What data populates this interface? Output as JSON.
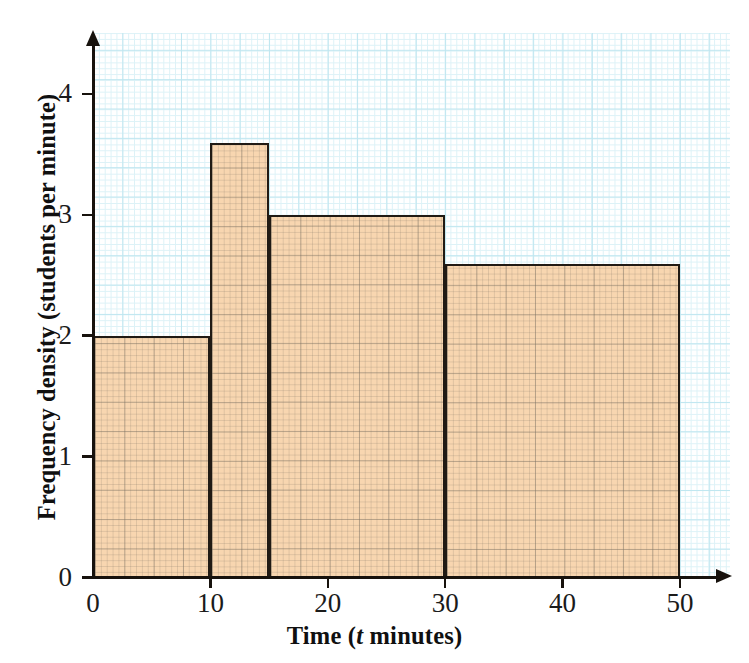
{
  "chart_data": {
    "type": "bar",
    "title": "",
    "subtitle": "",
    "xlabel_parts": {
      "before": "Time (",
      "italic": "t",
      "after": " minutes)"
    },
    "xlabel": "Time (t minutes)",
    "ylabel": "Frequency density (students per minute)",
    "xlim": [
      0,
      50
    ],
    "ylim": [
      0,
      4.5
    ],
    "x_ticks": [
      0,
      10,
      20,
      30,
      40,
      50
    ],
    "x_tick_labels": [
      "0",
      "10",
      "20",
      "30",
      "40",
      "50"
    ],
    "y_ticks": [
      0,
      1,
      2,
      3,
      4
    ],
    "y_tick_labels": [
      "0",
      "1",
      "2",
      "3",
      "4"
    ],
    "grid": "graph-paper",
    "legend": "none",
    "bin_edges": [
      0,
      10,
      15,
      30,
      50
    ],
    "categories": [
      "0 < t ≤ 10",
      "10 < t ≤ 15",
      "15 < t ≤ 30",
      "30 < t ≤ 50"
    ],
    "values": [
      2.0,
      3.6,
      3.0,
      2.6
    ],
    "bars": [
      {
        "label": "0 < t ≤ 10",
        "start": 0,
        "end": 10,
        "frequency_density": 2.0,
        "frequency": 20
      },
      {
        "label": "10 < t ≤ 15",
        "start": 10,
        "end": 15,
        "frequency_density": 3.6,
        "frequency": 18
      },
      {
        "label": "15 < t ≤ 30",
        "start": 15,
        "end": 30,
        "frequency_density": 3.0,
        "frequency": 45
      },
      {
        "label": "30 < t ≤ 50",
        "start": 30,
        "end": 50,
        "frequency_density": 2.6,
        "frequency": 52
      }
    ],
    "colors": {
      "bar_fill": "#f8d6b0",
      "bar_outline": "#201a14",
      "grid_minor": "#ddf2f7",
      "grid_major": "#bfe6f0",
      "axis": "#17120d",
      "background": "#ffffff"
    }
  }
}
